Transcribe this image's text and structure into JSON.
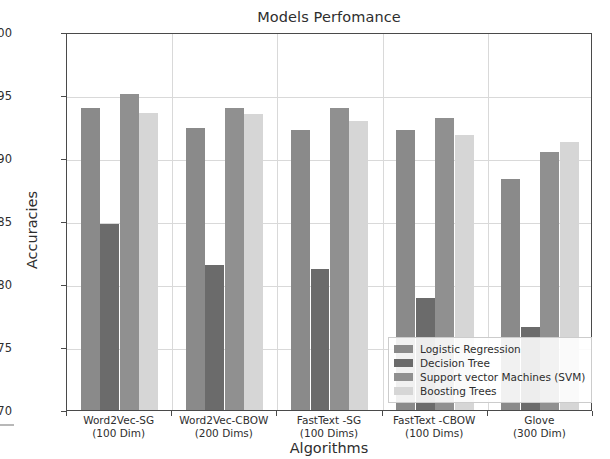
{
  "chart_data": {
    "type": "bar",
    "title": "Models Perfomance",
    "xlabel": "Algorithms",
    "ylabel": "Accuracies",
    "ylim": [
      0.7,
      1.0
    ],
    "ytick_labels": [
      "0.70",
      "0.75",
      "0.80",
      "0.85",
      "0.90",
      "0.95",
      "1.00"
    ],
    "ytick_values": [
      0.7,
      0.75,
      0.8,
      0.85,
      0.9,
      0.95,
      1.0
    ],
    "grid": true,
    "legend_position": "lower right",
    "categories": [
      "Word2Vec-SG\n(100 Dim)",
      "Word2Vec-CBOW\n(200 Dims)",
      "FastText -SG\n(100 Dims)",
      "FastText -CBOW\n(100 Dims)",
      "Glove\n(300 Dim)"
    ],
    "category_lines": [
      [
        "Word2Vec-SG",
        "(100 Dim)"
      ],
      [
        "Word2Vec-CBOW",
        "(200 Dims)"
      ],
      [
        "FastText -SG",
        "(100 Dims)"
      ],
      [
        "FastText -CBOW",
        "(100 Dims)"
      ],
      [
        "Glove",
        "(300 Dim)"
      ]
    ],
    "series": [
      {
        "name": "Logistic Regression",
        "color": "#8a8a8a",
        "values": [
          0.94,
          0.924,
          0.922,
          0.922,
          0.883
        ]
      },
      {
        "name": "Decision Tree",
        "color": "#6b6b6b",
        "values": [
          0.848,
          0.815,
          0.812,
          0.789,
          0.766
        ]
      },
      {
        "name": "Support vector Machines (SVM)",
        "color": "#909090",
        "values": [
          0.951,
          0.94,
          0.94,
          0.932,
          0.905
        ]
      },
      {
        "name": "Boosting Trees",
        "color": "#d6d6d6",
        "values": [
          0.936,
          0.935,
          0.929,
          0.918,
          0.913
        ]
      }
    ]
  }
}
